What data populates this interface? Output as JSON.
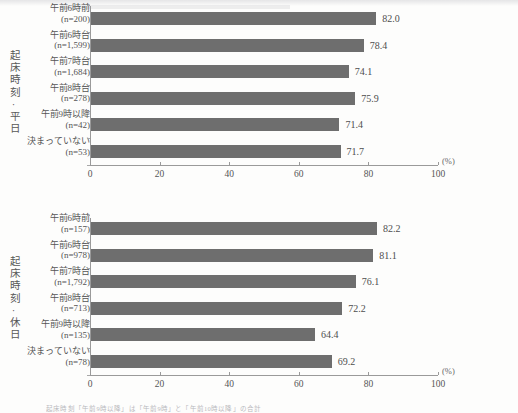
{
  "axis": {
    "tick_labels": [
      "0",
      "20",
      "40",
      "60",
      "80",
      "100"
    ],
    "unit_label": "(%)",
    "min": 0,
    "max": 100
  },
  "charts": [
    {
      "group_title": "起床時刻·平日",
      "categories": [
        {
          "label": "午前6時前",
          "n": "(n=200)"
        },
        {
          "label": "午前6時台",
          "n": "(n=1,599)"
        },
        {
          "label": "午前7時台",
          "n": "(n=1,684)"
        },
        {
          "label": "午前8時台",
          "n": "(n=278)"
        },
        {
          "label": "午前9時以降",
          "n": "(n=42)"
        },
        {
          "label": "決まっていない",
          "n": "(n=53)"
        }
      ],
      "values": [
        "82.0",
        "78.4",
        "74.1",
        "75.9",
        "71.4",
        "71.7"
      ]
    },
    {
      "group_title": "起床時刻·休日",
      "categories": [
        {
          "label": "午前6時前",
          "n": "(n=157)"
        },
        {
          "label": "午前6時台",
          "n": "(n=978)"
        },
        {
          "label": "午前7時台",
          "n": "(n=1,792)"
        },
        {
          "label": "午前8時台",
          "n": "(n=713)"
        },
        {
          "label": "午前9時以降",
          "n": "(n=135)"
        },
        {
          "label": "決まっていない",
          "n": "(n=78)"
        }
      ],
      "values": [
        "82.2",
        "81.1",
        "76.1",
        "72.2",
        "64.4",
        "69.2"
      ]
    }
  ],
  "footnote": "起床時刻「午前9時以降」は「午前9時」と「午前10時以降」の合計",
  "colors": {
    "bar": "#6e6e6e",
    "axis": "#9a9a9a",
    "text": "#555555"
  },
  "chart_data": [
    {
      "type": "bar",
      "orientation": "horizontal",
      "title": "起床時刻·平日",
      "categories": [
        "午前6時前 (n=200)",
        "午前6時台 (n=1,599)",
        "午前7時台 (n=1,684)",
        "午前8時台 (n=278)",
        "午前9時以降 (n=42)",
        "決まっていない (n=53)"
      ],
      "values": [
        82.0,
        78.4,
        74.1,
        75.9,
        71.4,
        71.7
      ],
      "xlabel": "(%)",
      "ylabel": "起床時刻·平日",
      "xlim": [
        0,
        100
      ],
      "xticks": [
        0,
        20,
        40,
        60,
        80,
        100
      ],
      "grid": false,
      "legend": "none",
      "data_labels": [
        "82.0",
        "78.4",
        "74.1",
        "75.9",
        "71.4",
        "71.7"
      ]
    },
    {
      "type": "bar",
      "orientation": "horizontal",
      "title": "起床時刻·休日",
      "categories": [
        "午前6時前 (n=157)",
        "午前6時台 (n=978)",
        "午前7時台 (n=1,792)",
        "午前8時台 (n=713)",
        "午前9時以降 (n=135)",
        "決まっていない (n=78)"
      ],
      "values": [
        82.2,
        81.1,
        76.1,
        72.2,
        64.4,
        69.2
      ],
      "xlabel": "(%)",
      "ylabel": "起床時刻·休日",
      "xlim": [
        0,
        100
      ],
      "xticks": [
        0,
        20,
        40,
        60,
        80,
        100
      ],
      "grid": false,
      "legend": "none",
      "data_labels": [
        "82.2",
        "81.1",
        "76.1",
        "72.2",
        "64.4",
        "69.2"
      ]
    }
  ]
}
